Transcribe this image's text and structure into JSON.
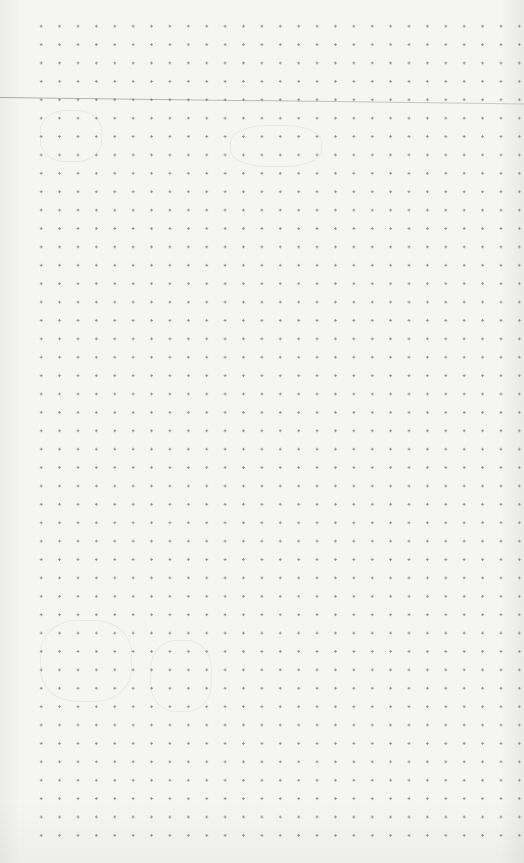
{
  "page": {
    "type": "dot-grid paper",
    "background_color": "#f5f5f4",
    "dot_color": "#8e8e8e",
    "dot_spacing_px": 18.4,
    "columns": 27,
    "rows": 44,
    "rule_line": {
      "y_start": 97,
      "y_end": 104,
      "color": "#7a7a7a"
    }
  }
}
